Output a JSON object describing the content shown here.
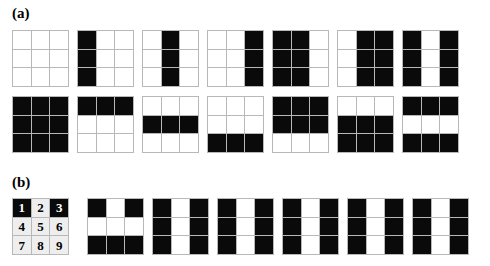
{
  "figure": {
    "panels": [
      {
        "id": "a",
        "label": "(a)"
      },
      {
        "id": "b",
        "label": "(b)"
      }
    ]
  },
  "chart_data": {
    "type": "heatmap",
    "title": "",
    "xlabel": "",
    "ylabel": "",
    "cell_values": {
      "black": 1,
      "white": 0
    },
    "colors": {
      "black": "#0a0a0a",
      "white": "#ffffff",
      "grid_line": "#b8b8b8",
      "numbered_cell": "#eeeeee"
    },
    "panels": [
      {
        "id": "a",
        "label": "(a)",
        "rows": [
          {
            "name": "column-patterns",
            "grids": [
              {
                "name": "empty",
                "matrix": [
                  [
                    0,
                    0,
                    0
                  ],
                  [
                    0,
                    0,
                    0
                  ],
                  [
                    0,
                    0,
                    0
                  ]
                ]
              },
              {
                "name": "left-column",
                "matrix": [
                  [
                    1,
                    0,
                    0
                  ],
                  [
                    1,
                    0,
                    0
                  ],
                  [
                    1,
                    0,
                    0
                  ]
                ]
              },
              {
                "name": "middle-column",
                "matrix": [
                  [
                    0,
                    1,
                    0
                  ],
                  [
                    0,
                    1,
                    0
                  ],
                  [
                    0,
                    1,
                    0
                  ]
                ]
              },
              {
                "name": "right-column",
                "matrix": [
                  [
                    0,
                    0,
                    1
                  ],
                  [
                    0,
                    0,
                    1
                  ],
                  [
                    0,
                    0,
                    1
                  ]
                ]
              },
              {
                "name": "left-middle-columns",
                "matrix": [
                  [
                    1,
                    1,
                    0
                  ],
                  [
                    1,
                    1,
                    0
                  ],
                  [
                    1,
                    1,
                    0
                  ]
                ]
              },
              {
                "name": "middle-right-columns",
                "matrix": [
                  [
                    0,
                    1,
                    1
                  ],
                  [
                    0,
                    1,
                    1
                  ],
                  [
                    0,
                    1,
                    1
                  ]
                ]
              },
              {
                "name": "left-right-columns",
                "matrix": [
                  [
                    1,
                    0,
                    1
                  ],
                  [
                    1,
                    0,
                    1
                  ],
                  [
                    1,
                    0,
                    1
                  ]
                ]
              }
            ]
          },
          {
            "name": "row-patterns",
            "grids": [
              {
                "name": "full",
                "matrix": [
                  [
                    1,
                    1,
                    1
                  ],
                  [
                    1,
                    1,
                    1
                  ],
                  [
                    1,
                    1,
                    1
                  ]
                ]
              },
              {
                "name": "top-row",
                "matrix": [
                  [
                    1,
                    1,
                    1
                  ],
                  [
                    0,
                    0,
                    0
                  ],
                  [
                    0,
                    0,
                    0
                  ]
                ]
              },
              {
                "name": "middle-row",
                "matrix": [
                  [
                    0,
                    0,
                    0
                  ],
                  [
                    1,
                    1,
                    1
                  ],
                  [
                    0,
                    0,
                    0
                  ]
                ]
              },
              {
                "name": "bottom-row",
                "matrix": [
                  [
                    0,
                    0,
                    0
                  ],
                  [
                    0,
                    0,
                    0
                  ],
                  [
                    1,
                    1,
                    1
                  ]
                ]
              },
              {
                "name": "top-middle-rows",
                "matrix": [
                  [
                    1,
                    1,
                    1
                  ],
                  [
                    1,
                    1,
                    1
                  ],
                  [
                    0,
                    0,
                    0
                  ]
                ]
              },
              {
                "name": "middle-bottom-rows",
                "matrix": [
                  [
                    0,
                    0,
                    0
                  ],
                  [
                    1,
                    1,
                    1
                  ],
                  [
                    1,
                    1,
                    1
                  ]
                ]
              },
              {
                "name": "top-bottom-rows",
                "matrix": [
                  [
                    1,
                    1,
                    1
                  ],
                  [
                    0,
                    0,
                    0
                  ],
                  [
                    1,
                    1,
                    1
                  ]
                ]
              }
            ]
          }
        ]
      },
      {
        "id": "b",
        "label": "(b)",
        "rows": [
          {
            "name": "indexed-and-symmetric-patterns",
            "numbered_grid": {
              "name": "cell-index-reference",
              "numbers": [
                [
                  "1",
                  "2",
                  "3"
                ],
                [
                  "4",
                  "5",
                  "6"
                ],
                [
                  "7",
                  "8",
                  "9"
                ]
              ],
              "matrix": [
                [
                  1,
                  0,
                  1
                ],
                [
                  0,
                  0,
                  0
                ],
                [
                  0,
                  0,
                  0
                ]
              ]
            },
            "grids": [
              {
                "name": "h-bar-middle-row-and-top-center",
                "matrix": [
                  [
                    1,
                    0,
                    1
                  ],
                  [
                    0,
                    0,
                    0
                  ],
                  [
                    1,
                    1,
                    1
                  ]
                ]
              },
              {
                "name": "middle-column-white",
                "matrix": [
                  [
                    1,
                    0,
                    1
                  ],
                  [
                    1,
                    0,
                    1
                  ],
                  [
                    1,
                    0,
                    1
                  ]
                ]
              },
              {
                "name": "middle-column-white-2",
                "matrix": [
                  [
                    1,
                    0,
                    1
                  ],
                  [
                    1,
                    0,
                    1
                  ],
                  [
                    1,
                    0,
                    1
                  ]
                ]
              },
              {
                "name": "middle-column-white-3",
                "matrix": [
                  [
                    1,
                    0,
                    1
                  ],
                  [
                    1,
                    0,
                    1
                  ],
                  [
                    1,
                    0,
                    1
                  ]
                ]
              },
              {
                "name": "middle-column-white-4",
                "matrix": [
                  [
                    1,
                    0,
                    1
                  ],
                  [
                    1,
                    0,
                    1
                  ],
                  [
                    1,
                    0,
                    1
                  ]
                ]
              },
              {
                "name": "middle-column-white-5",
                "matrix": [
                  [
                    1,
                    0,
                    1
                  ],
                  [
                    1,
                    0,
                    1
                  ],
                  [
                    1,
                    0,
                    1
                  ]
                ]
              }
            ]
          }
        ]
      }
    ]
  }
}
